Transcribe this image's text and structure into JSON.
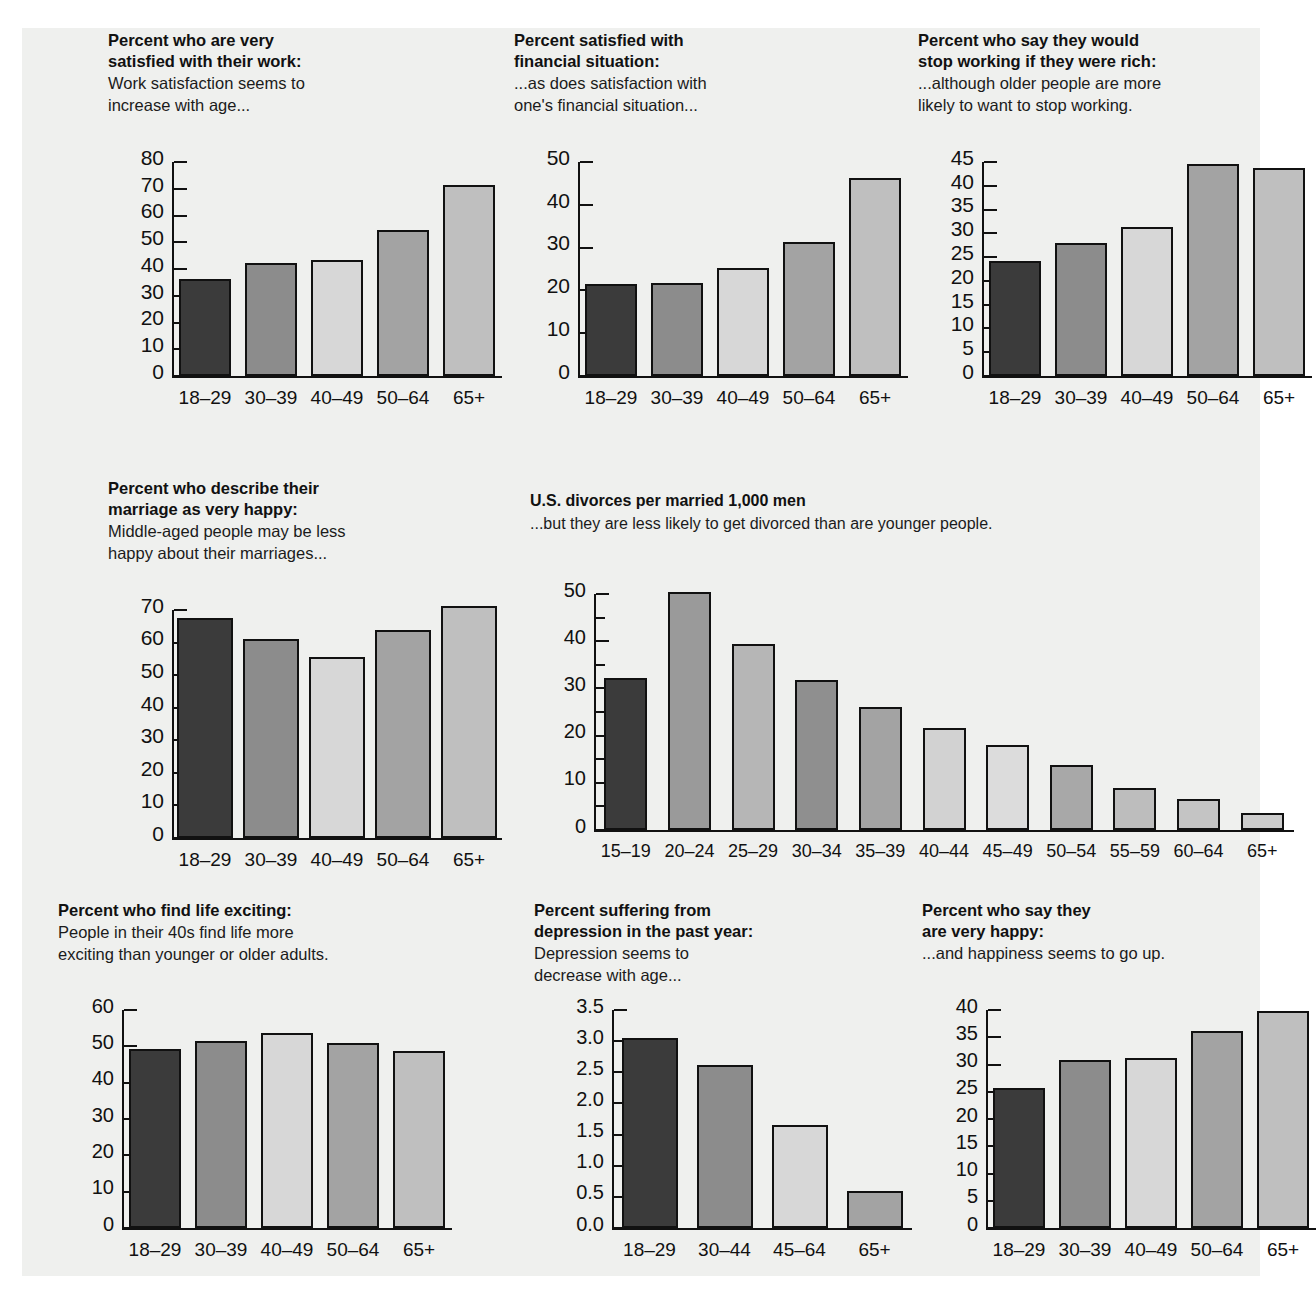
{
  "figure": {
    "background": "#eff0ee",
    "palette": [
      "#3b3b3b",
      "#8c8c8c",
      "#d7d7d7",
      "#a3a3a3",
      "#bfbfbf"
    ],
    "divorce_palette": [
      "#3b3b3b",
      "#9a9a9a",
      "#b6b6b6",
      "#8f8f8f",
      "#a3a3a3",
      "#d2d2d2",
      "#dcdcdc",
      "#a8a8a8",
      "#bdbdbd",
      "#c4c4c4",
      "#cccccc"
    ]
  },
  "chart_data": [
    {
      "id": "work-satisfaction",
      "type": "bar",
      "title": "Percent who are very\nsatisfied with their work:",
      "title_lines": [
        "Percent who are very",
        "satisfied with their work:"
      ],
      "subtitle_lines": [
        "Work satisfaction seems to",
        "increase with age..."
      ],
      "categories": [
        "18–29",
        "30–39",
        "40–49",
        "50–64",
        "65+"
      ],
      "values": [
        36.3,
        42.2,
        43.5,
        54.5,
        71.5
      ],
      "yticks": [
        0,
        10,
        20,
        30,
        40,
        50,
        60,
        70,
        80
      ],
      "ylim": [
        0,
        80
      ],
      "xlabel": "",
      "ylabel": "",
      "grid": false,
      "legend": "none"
    },
    {
      "id": "financial-satisfaction",
      "type": "bar",
      "title_lines": [
        "Percent satisfied with",
        "financial situation:"
      ],
      "subtitle_lines": [
        "...as does satisfaction with",
        "one's financial situation..."
      ],
      "categories": [
        "18–29",
        "30–39",
        "40–49",
        "50–64",
        "65+"
      ],
      "values": [
        21.6,
        21.7,
        25.3,
        31.4,
        46.2
      ],
      "yticks": [
        0,
        10,
        20,
        30,
        40,
        50
      ],
      "ylim": [
        0,
        50
      ],
      "xlabel": "",
      "ylabel": "",
      "grid": false,
      "legend": "none"
    },
    {
      "id": "stop-working-if-rich",
      "type": "bar",
      "title_lines": [
        "Percent who say they would",
        "stop working if they were rich:"
      ],
      "subtitle_lines": [
        "...although older people are more",
        "likely to want to stop working."
      ],
      "categories": [
        "18–29",
        "30–39",
        "40–49",
        "50–64",
        "65+"
      ],
      "values": [
        24.2,
        28.0,
        31.3,
        44.6,
        43.7
      ],
      "yticks": [
        0,
        5,
        10,
        15,
        20,
        25,
        30,
        35,
        40,
        45
      ],
      "ylim": [
        0,
        45
      ],
      "xlabel": "",
      "ylabel": "",
      "grid": false,
      "legend": "none"
    },
    {
      "id": "marriage-very-happy",
      "type": "bar",
      "title_lines": [
        "Percent who describe their",
        "marriage as very happy:"
      ],
      "subtitle_lines": [
        "Middle-aged people may be less",
        "happy about their marriages..."
      ],
      "categories": [
        "18–29",
        "30–39",
        "40–49",
        "50–64",
        "65+"
      ],
      "values": [
        67.6,
        61.0,
        55.5,
        64.0,
        71.2
      ],
      "yticks": [
        0,
        10,
        20,
        30,
        40,
        50,
        60,
        70
      ],
      "ylim": [
        0,
        70
      ],
      "xlabel": "",
      "ylabel": "",
      "grid": false,
      "legend": "none"
    },
    {
      "id": "us-divorces",
      "type": "bar",
      "title_lines": [
        "U.S. divorces per married 1,000 men"
      ],
      "subtitle_lines": [
        "...but they are less likely to get divorced than are younger people."
      ],
      "categories": [
        "15–19",
        "20–24",
        "25–29",
        "30–34",
        "35–39",
        "40–44",
        "45–49",
        "50–54",
        "55–59",
        "60–64",
        "65+"
      ],
      "values": [
        32.3,
        50.5,
        39.5,
        31.8,
        26.0,
        21.6,
        18.0,
        13.8,
        8.8,
        6.6,
        3.7
      ],
      "yticks": [
        0,
        10,
        20,
        30,
        40,
        50
      ],
      "minor_yticks": [
        5,
        15,
        25,
        35,
        45
      ],
      "ylim": [
        0,
        50
      ],
      "xlabel": "",
      "ylabel": "",
      "grid": false,
      "legend": "none"
    },
    {
      "id": "life-exciting",
      "type": "bar",
      "title_lines": [
        "Percent who find life exciting:"
      ],
      "subtitle_lines": [
        "People in their 40s find life more",
        "exciting than younger or older adults."
      ],
      "categories": [
        "18–29",
        "30–39",
        "40–49",
        "50–64",
        "65+"
      ],
      "values": [
        49.3,
        51.5,
        53.7,
        51.0,
        48.7
      ],
      "yticks": [
        0,
        10,
        20,
        30,
        40,
        50,
        60
      ],
      "ylim": [
        0,
        60
      ],
      "xlabel": "",
      "ylabel": "",
      "grid": false,
      "legend": "none"
    },
    {
      "id": "depression-past-year",
      "type": "bar",
      "title_lines": [
        "Percent suffering from",
        "depression in the past year:"
      ],
      "subtitle_lines": [
        "Depression seems to",
        "decrease with age..."
      ],
      "categories": [
        "18–29",
        "30–44",
        "45–64",
        "65+"
      ],
      "values": [
        3.05,
        2.62,
        1.65,
        0.6
      ],
      "yticks": [
        "0.0",
        "0.5",
        "1.0",
        "1.5",
        "2.0",
        "2.5",
        "3.0",
        "3.5"
      ],
      "ytick_values": [
        0,
        0.5,
        1.0,
        1.5,
        2.0,
        2.5,
        3.0,
        3.5
      ],
      "ylim": [
        0,
        3.5
      ],
      "xlabel": "",
      "ylabel": "",
      "grid": false,
      "legend": "none"
    },
    {
      "id": "very-happy",
      "type": "bar",
      "title_lines": [
        "Percent who say they",
        "are very happy:"
      ],
      "subtitle_lines": [
        "...and happiness seems to go up."
      ],
      "categories": [
        "18–29",
        "30–39",
        "40–49",
        "50–64",
        "65+"
      ],
      "values": [
        25.6,
        30.9,
        31.2,
        36.2,
        39.8
      ],
      "yticks": [
        0,
        5,
        10,
        15,
        20,
        25,
        30,
        35,
        40
      ],
      "ylim": [
        0,
        40
      ],
      "xlabel": "",
      "ylabel": "",
      "grid": false,
      "legend": "none"
    }
  ]
}
